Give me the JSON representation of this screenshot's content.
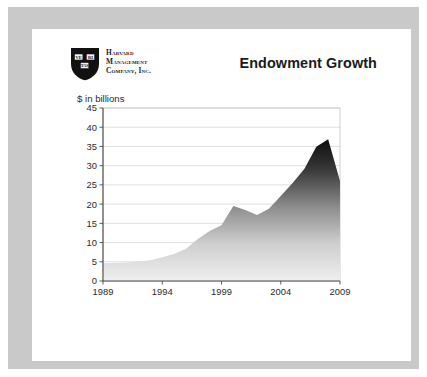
{
  "slide": {
    "title": "Endowment Growth",
    "logo": {
      "icon": "harvard-shield-icon",
      "shield_books": [
        "VE",
        "RI",
        "TAS"
      ],
      "line_1": "Harvard",
      "line_2": "Management",
      "line_3": "Company, Inc."
    },
    "frame_color": "#c9c9c9",
    "panel_color": "#ffffff"
  },
  "chart_data": {
    "type": "area",
    "title": "Endowment Growth",
    "xlabel": "",
    "ylabel": "$ in billions",
    "ylim": [
      0,
      45
    ],
    "xlim": [
      1989,
      2009
    ],
    "yticks": [
      0,
      5,
      10,
      15,
      20,
      25,
      30,
      35,
      40,
      45
    ],
    "xticks": [
      1989,
      1994,
      1999,
      2004,
      2009
    ],
    "grid": true,
    "legend": false,
    "fill_gradient": [
      "#111111",
      "#e8e8e8"
    ],
    "x": [
      1989,
      1990,
      1991,
      1992,
      1993,
      1994,
      1995,
      1996,
      1997,
      1998,
      1999,
      2000,
      2001,
      2002,
      2003,
      2004,
      2005,
      2006,
      2007,
      2008,
      2009
    ],
    "values": [
      4.7,
      4.7,
      4.8,
      5.1,
      5.4,
      6.2,
      7.0,
      8.4,
      10.9,
      13.0,
      14.5,
      19.5,
      18.5,
      17.2,
      18.8,
      22.1,
      25.5,
      29.2,
      34.9,
      36.9,
      26.0
    ],
    "series": [
      {
        "name": "Endowment value",
        "values": [
          4.7,
          4.7,
          4.8,
          5.1,
          5.4,
          6.2,
          7.0,
          8.4,
          10.9,
          13.0,
          14.5,
          19.5,
          18.5,
          17.2,
          18.8,
          22.1,
          25.5,
          29.2,
          34.9,
          36.9,
          26.0
        ]
      }
    ]
  }
}
